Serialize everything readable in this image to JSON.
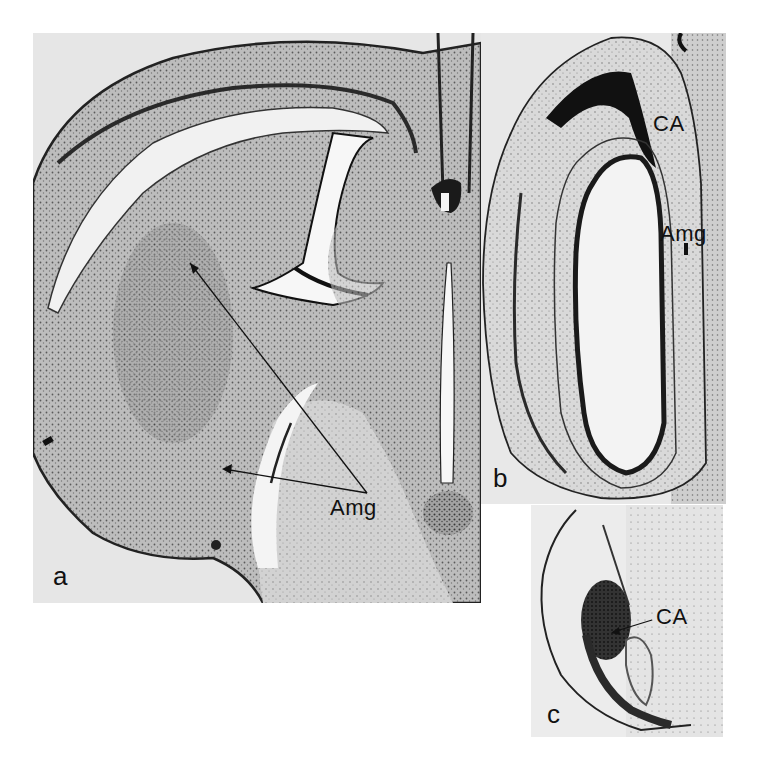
{
  "figure": {
    "panels": [
      {
        "id": "a",
        "letter": "a",
        "description": "Coronal brain section with cortex, ventricles and midline",
        "labels": [
          {
            "text": "Amg",
            "points_to": [
              "upper amygdala region",
              "lower amygdala region"
            ]
          }
        ]
      },
      {
        "id": "b",
        "letter": "b",
        "description": "Hippocampal/amygdala section with elongated oval structure",
        "labels": [
          {
            "text": "CA"
          },
          {
            "text": "Amg"
          }
        ]
      },
      {
        "id": "c",
        "letter": "c",
        "description": "Section with dense stained CA region",
        "labels": [
          {
            "text": "CA"
          }
        ]
      }
    ],
    "colors": {
      "background": "#ffffff",
      "tissue": "#c9c9c9",
      "stain_dark": "#1a1a1a",
      "panel_bg": "#e6e6e6"
    }
  }
}
